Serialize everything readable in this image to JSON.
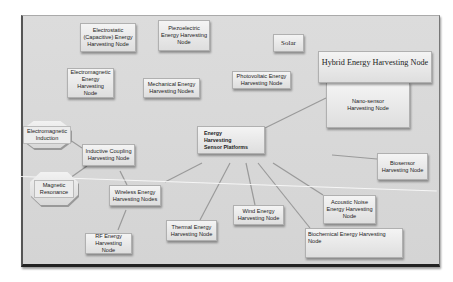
{
  "diagram": {
    "title": "Energy Harvesting Sensor Platforms",
    "center_node": "Energy Harvesting Sensor Platforms",
    "nodes": {
      "electrostatic": "Electrostatic (Capacitive) Energy Harvesting Node",
      "piezoelectric": "Piezoelectric Energy Harvesting Node",
      "solar": "Solar",
      "hybrid": "Hybrid Energy Harvesting Node",
      "electromagnetic": "Electromagnetic Energy Harvesting Node",
      "mechanical": "Mechanical Energy Harvesting Nodes",
      "photovoltaic": "Photovoltaic Energy Harvesting Node",
      "nano_sensor": "Nano-sensor Harvesting Node",
      "em_induction": "Electromagnetic Induction",
      "inductive_coupling": "Inductive Coupling Harvesting Node",
      "center": "Energy Harvesting Sensor Platforms",
      "biosensor": "Biosensor Harvesting  Node",
      "magnetic_resonance": "Magnetic Resonance",
      "wireless": "Wireless Energy Harvesting Nodes",
      "acoustic": "Acoustic Noise Energy Harvesting Node",
      "thermal": "Thermal Energy Harvesting Node",
      "wind": "Wind Energy Harvesting  Node",
      "biochemical": "Biochemical Energy Harvesting Node",
      "rf": "RF Energy Harvesting Node"
    },
    "edges": [
      [
        "center",
        "nano_sensor"
      ],
      [
        "center",
        "biosensor"
      ],
      [
        "center",
        "acoustic"
      ],
      [
        "center",
        "biochemical"
      ],
      [
        "center",
        "wind"
      ],
      [
        "center",
        "thermal"
      ],
      [
        "center",
        "wireless"
      ],
      [
        "wireless",
        "inductive_coupling"
      ],
      [
        "wireless",
        "rf"
      ],
      [
        "inductive_coupling",
        "magnetic_resonance"
      ],
      [
        "inductive_coupling",
        "em_induction"
      ]
    ],
    "colors": {
      "canvas": "#d9d9d9",
      "node_fill": "#eeeeee",
      "edge": "#9a9a9a",
      "text": "#222222"
    }
  }
}
